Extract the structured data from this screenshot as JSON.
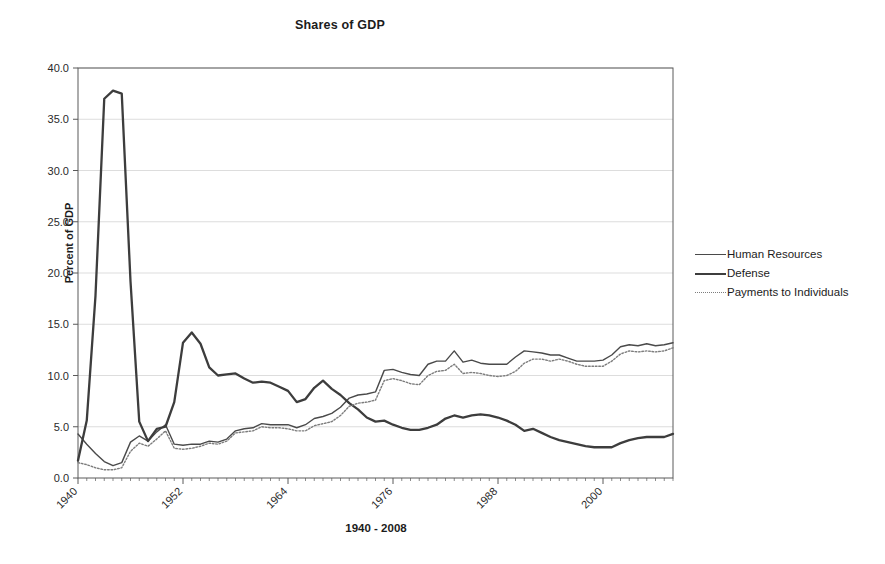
{
  "chart_data": {
    "type": "line",
    "title": "Shares of GDP",
    "xlabel": "1940 - 2008",
    "ylabel": "Percent of GDP",
    "ylim": [
      0.0,
      40.0
    ],
    "yticks": [
      "0.0",
      "5.0",
      "10.0",
      "15.0",
      "20.0",
      "25.0",
      "30.0",
      "35.0",
      "40.0"
    ],
    "ytick_values": [
      0,
      5,
      10,
      15,
      20,
      25,
      30,
      35,
      40
    ],
    "xlim": [
      1940,
      2008
    ],
    "xticks": [
      "1940",
      "1952",
      "1964",
      "1976",
      "1988",
      "2000"
    ],
    "xtick_values": [
      1940,
      1952,
      1964,
      1976,
      1988,
      2000
    ],
    "grid": "horizontal",
    "legend_position": "right",
    "x": [
      1940,
      1941,
      1942,
      1943,
      1944,
      1945,
      1946,
      1947,
      1948,
      1949,
      1950,
      1951,
      1952,
      1953,
      1954,
      1955,
      1956,
      1957,
      1958,
      1959,
      1960,
      1961,
      1962,
      1963,
      1964,
      1965,
      1966,
      1967,
      1968,
      1969,
      1970,
      1971,
      1972,
      1973,
      1974,
      1975,
      1976,
      1977,
      1978,
      1979,
      1980,
      1981,
      1982,
      1983,
      1984,
      1985,
      1986,
      1987,
      1988,
      1989,
      1990,
      1991,
      1992,
      1993,
      1994,
      1995,
      1996,
      1997,
      1998,
      1999,
      2000,
      2001,
      2002,
      2003,
      2004,
      2005,
      2006,
      2007,
      2008
    ],
    "series": [
      {
        "name": "Human Resources",
        "style": "solid-thin",
        "color": "#4a4a4a",
        "values": [
          4.3,
          3.3,
          2.4,
          1.6,
          1.2,
          1.5,
          3.5,
          4.1,
          3.6,
          4.5,
          5.2,
          3.3,
          3.2,
          3.3,
          3.3,
          3.6,
          3.5,
          3.8,
          4.6,
          4.8,
          4.9,
          5.3,
          5.2,
          5.2,
          5.2,
          4.9,
          5.2,
          5.8,
          6.0,
          6.3,
          6.9,
          7.8,
          8.1,
          8.2,
          8.4,
          10.5,
          10.6,
          10.3,
          10.1,
          10.0,
          11.1,
          11.4,
          11.4,
          12.4,
          11.3,
          11.5,
          11.2,
          11.1,
          11.1,
          11.1,
          11.8,
          12.4,
          12.3,
          12.2,
          12.0,
          12.0,
          11.7,
          11.4,
          11.4,
          11.4,
          11.5,
          12.0,
          12.8,
          13.0,
          12.9,
          13.1,
          12.9,
          13.0,
          13.2
        ]
      },
      {
        "name": "Defense",
        "style": "solid-thick",
        "color": "#3d3d3d",
        "values": [
          1.7,
          5.6,
          17.8,
          37.0,
          37.8,
          37.5,
          19.2,
          5.5,
          3.6,
          4.8,
          5.0,
          7.4,
          13.2,
          14.2,
          13.1,
          10.8,
          10.0,
          10.1,
          10.2,
          9.7,
          9.3,
          9.4,
          9.3,
          8.9,
          8.5,
          7.4,
          7.7,
          8.8,
          9.5,
          8.7,
          8.1,
          7.3,
          6.7,
          5.9,
          5.5,
          5.6,
          5.2,
          4.9,
          4.7,
          4.7,
          4.9,
          5.2,
          5.8,
          6.1,
          5.9,
          6.1,
          6.2,
          6.1,
          5.9,
          5.6,
          5.2,
          4.6,
          4.8,
          4.4,
          4.0,
          3.7,
          3.5,
          3.3,
          3.1,
          3.0,
          3.0,
          3.0,
          3.4,
          3.7,
          3.9,
          4.0,
          4.0,
          4.0,
          4.3
        ]
      },
      {
        "name": "Payments to Individuals",
        "style": "dotted",
        "color": "#7d7d7d",
        "values": [
          1.5,
          1.3,
          1.0,
          0.8,
          0.8,
          1.0,
          2.6,
          3.4,
          3.1,
          3.8,
          4.6,
          2.9,
          2.8,
          2.9,
          3.1,
          3.4,
          3.3,
          3.6,
          4.4,
          4.5,
          4.6,
          5.0,
          4.9,
          4.9,
          4.8,
          4.6,
          4.6,
          5.1,
          5.3,
          5.5,
          6.1,
          7.0,
          7.3,
          7.4,
          7.6,
          9.5,
          9.7,
          9.5,
          9.2,
          9.1,
          10.0,
          10.4,
          10.5,
          11.1,
          10.2,
          10.3,
          10.2,
          10.0,
          9.9,
          10.0,
          10.4,
          11.2,
          11.6,
          11.6,
          11.4,
          11.6,
          11.4,
          11.1,
          10.9,
          10.9,
          10.9,
          11.4,
          12.1,
          12.4,
          12.3,
          12.4,
          12.3,
          12.4,
          12.7
        ]
      }
    ]
  },
  "legend": {
    "items": [
      {
        "label": "Human Resources"
      },
      {
        "label": "Defense"
      },
      {
        "label": "Payments to Individuals"
      }
    ]
  }
}
